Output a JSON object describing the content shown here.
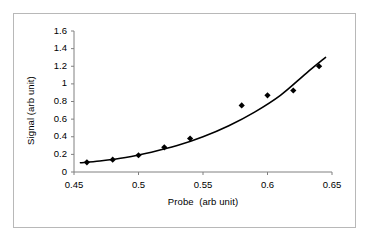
{
  "chart_data": {
    "type": "scatter",
    "title": "",
    "xlabel": "Probe  (arb unit)",
    "ylabel": "Signal (arb unit)",
    "xlim": [
      0.45,
      0.65
    ],
    "ylim": [
      0,
      1.6
    ],
    "xticks": [
      "0.45",
      "0.5",
      "0.55",
      "0.6",
      "0.65"
    ],
    "xtick_values": [
      0.45,
      0.5,
      0.55,
      0.6,
      0.65
    ],
    "yticks": [
      "0",
      "0.2",
      "0.4",
      "0.6",
      "0.8",
      "1",
      "1.2",
      "1.4",
      "1.6"
    ],
    "ytick_values": [
      0,
      0.2,
      0.4,
      0.6,
      0.8,
      1.0,
      1.2,
      1.4,
      1.6
    ],
    "grid": false,
    "legend": null,
    "marker": "diamond",
    "marker_color": "#000000",
    "line_color": "#000000",
    "series": [
      {
        "name": "measured signal",
        "kind": "markers",
        "x": [
          0.46,
          0.48,
          0.5,
          0.52,
          0.54,
          0.58,
          0.6,
          0.62,
          0.64
        ],
        "y": [
          0.11,
          0.14,
          0.19,
          0.28,
          0.38,
          0.755,
          0.87,
          0.925,
          1.2
        ]
      },
      {
        "name": "fitted curve",
        "kind": "line",
        "x": [
          0.455,
          0.47,
          0.49,
          0.51,
          0.53,
          0.55,
          0.57,
          0.59,
          0.61,
          0.63,
          0.645
        ],
        "y": [
          0.105,
          0.125,
          0.165,
          0.225,
          0.3,
          0.4,
          0.525,
          0.68,
          0.87,
          1.12,
          1.3
        ]
      }
    ]
  }
}
